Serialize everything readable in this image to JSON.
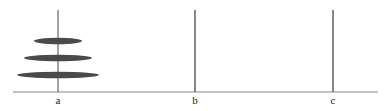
{
  "diagram": {
    "type": "tower-of-hanoi",
    "colors": {
      "disk": "#4a4a4a",
      "peg": "#555555",
      "base": "#777777"
    },
    "pegs": [
      {
        "label": "a",
        "x": 58
      },
      {
        "label": "b",
        "x": 195
      },
      {
        "label": "c",
        "x": 333
      }
    ],
    "disks": [
      {
        "peg": "a",
        "order": 1,
        "cx": 58,
        "cy": 41,
        "rx": 24,
        "ry": 3.2
      },
      {
        "peg": "a",
        "order": 2,
        "cx": 58,
        "cy": 58,
        "rx": 34,
        "ry": 3.2
      },
      {
        "peg": "a",
        "order": 3,
        "cx": 58,
        "cy": 75,
        "rx": 41,
        "ry": 3.2
      }
    ]
  }
}
